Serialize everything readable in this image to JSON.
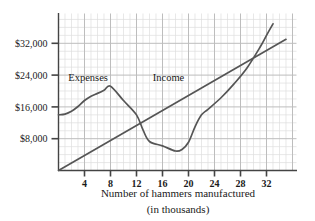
{
  "chart_data": {
    "type": "line",
    "title": "",
    "xlabel": "Number of hammers manufactured (in thousands)",
    "xlabel_line1": "Number of hammers manufactured",
    "xlabel_line2": "(in thousands)",
    "ylabel": "",
    "xlim": [
      0,
      35
    ],
    "ylim": [
      0,
      40000
    ],
    "xticks": [
      4,
      8,
      12,
      16,
      20,
      24,
      28,
      32
    ],
    "xtick_labels": [
      "4",
      "8",
      "12",
      "16",
      "20",
      "24",
      "28",
      "32"
    ],
    "yticks": [
      8000,
      16000,
      24000,
      32000
    ],
    "ytick_labels": [
      "$8,000",
      "$16,000",
      "$24,000",
      "$32,000"
    ],
    "grid": true,
    "grid_minor_step_x": 1,
    "grid_major_step_x": 4,
    "legend_position": "inline-annotations",
    "series": [
      {
        "name": "Expenses",
        "label": "Expenses",
        "label_x": 1.5,
        "label_y": 22500,
        "color": "#555555",
        "points": [
          [
            0,
            14000
          ],
          [
            1,
            14200
          ],
          [
            2,
            14900
          ],
          [
            3,
            16100
          ],
          [
            4,
            17600
          ],
          [
            5,
            18700
          ],
          [
            6,
            19400
          ],
          [
            7,
            20200
          ],
          [
            8,
            21200
          ],
          [
            10,
            17600
          ],
          [
            12,
            14000
          ],
          [
            13,
            10200
          ],
          [
            14,
            7300
          ],
          [
            16,
            6200
          ],
          [
            18,
            4900
          ],
          [
            19,
            5300
          ],
          [
            20,
            7100
          ],
          [
            21,
            11000
          ],
          [
            22,
            14000
          ],
          [
            23,
            15400
          ],
          [
            25,
            18300
          ],
          [
            27,
            21800
          ],
          [
            29,
            25800
          ],
          [
            31,
            31000
          ],
          [
            32,
            34000
          ],
          [
            33,
            36900
          ]
        ]
      },
      {
        "name": "Income",
        "label": "Income",
        "label_x": 14.5,
        "label_y": 22500,
        "color": "#555555",
        "points": [
          [
            0,
            0
          ],
          [
            35,
            33000
          ]
        ]
      }
    ],
    "annotations": [
      {
        "text": "Expenses",
        "x": 1.5,
        "y": 22500
      },
      {
        "text": "Income",
        "x": 14.5,
        "y": 22500
      }
    ],
    "colors": {
      "grid_minor": "#dedede",
      "grid_major": "#bdbdbd",
      "axis": "#444444",
      "curve": "#555555",
      "text": "#1a1a1a",
      "background": "#ffffff"
    }
  }
}
